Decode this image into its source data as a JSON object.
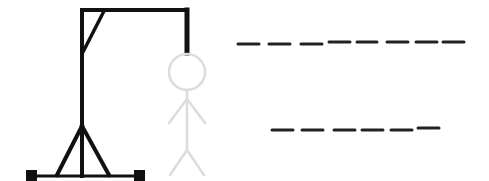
{
  "game": {
    "title": "Hangman",
    "word_rows": [
      {
        "row": 1,
        "letter_count": 8,
        "letters": [
          "",
          "",
          "",
          "",
          "",
          "",
          "",
          ""
        ]
      },
      {
        "row": 2,
        "letter_count": 6,
        "letters": [
          "",
          "",
          "",
          "",
          "",
          ""
        ]
      }
    ],
    "figure_state": "empty-outline",
    "colors": {
      "gallows": "#111111",
      "figure_outline": "#dcdcdc",
      "blank": "#222222",
      "background": "#ffffff"
    }
  }
}
